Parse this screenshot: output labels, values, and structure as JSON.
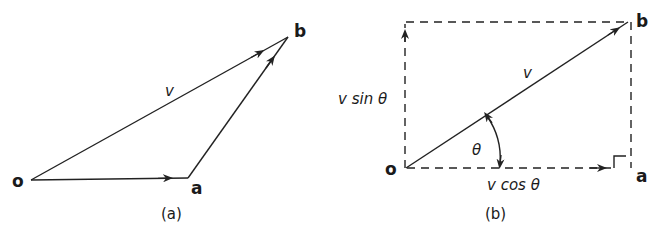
{
  "figure_a": {
    "caption": "(a)",
    "points": {
      "o": {
        "label": "o",
        "x": 31,
        "y": 180
      },
      "a": {
        "label": "a",
        "x": 188,
        "y": 178
      },
      "b": {
        "label": "b",
        "x": 288,
        "y": 37
      }
    },
    "vector_label": "v",
    "vectors": [
      {
        "from": "o",
        "to": "a",
        "style": "solid"
      },
      {
        "from": "a",
        "to": "b",
        "style": "solid"
      },
      {
        "from": "o",
        "to": "b",
        "style": "solid",
        "label": "v"
      }
    ]
  },
  "figure_b": {
    "caption": "(b)",
    "points": {
      "o": {
        "label": "o",
        "x": 406,
        "y": 168
      },
      "a": {
        "label": "a",
        "x": 628,
        "y": 168
      },
      "b": {
        "label": "b",
        "x": 628,
        "y": 22
      }
    },
    "vector_label": "v",
    "angle_label": "θ",
    "vertical_component_label": "v sin θ",
    "horizontal_component_label": "v cos θ",
    "right_angle_marker": true,
    "vectors": [
      {
        "from": "o",
        "to": "b",
        "style": "solid",
        "label": "v"
      },
      {
        "from": "o",
        "to": "a",
        "style": "dashed",
        "label": "v cos θ"
      },
      {
        "from": "o",
        "to": "top-left",
        "style": "dashed",
        "label": "v sin θ"
      }
    ]
  },
  "colors": {
    "stroke": "#222222",
    "text": "#1a1a1a",
    "background": "#ffffff"
  }
}
